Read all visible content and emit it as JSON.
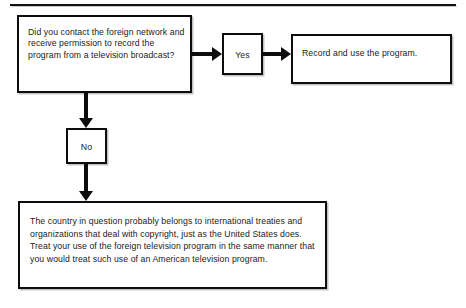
{
  "diagram": {
    "type": "flowchart",
    "title": "",
    "top_rule": "horizontal-rule",
    "nodes": [
      {
        "id": "question",
        "name": "decision-question-box",
        "text": "Did you contact the foreign network and receive permission to record the program from a television broadcast?"
      },
      {
        "id": "yes",
        "name": "yes-branch-box",
        "text": "Yes"
      },
      {
        "id": "record",
        "name": "record-outcome-box",
        "text": "Record and use the program."
      },
      {
        "id": "no",
        "name": "no-branch-box",
        "text": "No"
      },
      {
        "id": "conclusion",
        "name": "conclusion-box",
        "text": "The country in question probably belongs to international treaties and organizations that deal with copyright, just as the United States does. Treat your use of the foreign television program in the same manner that you would treat such use of an American television program."
      }
    ],
    "edges": [
      {
        "from": "question",
        "to": "yes",
        "direction": "right",
        "label": ""
      },
      {
        "from": "yes",
        "to": "record",
        "direction": "right",
        "label": ""
      },
      {
        "from": "question",
        "to": "no",
        "direction": "down",
        "label": ""
      },
      {
        "from": "no",
        "to": "conclusion",
        "direction": "down",
        "label": ""
      }
    ],
    "colors": {
      "background": "#ffffff",
      "border": "#0d0d0d",
      "text": "#1a1a1a",
      "arrow": "#0d0d0d"
    }
  }
}
